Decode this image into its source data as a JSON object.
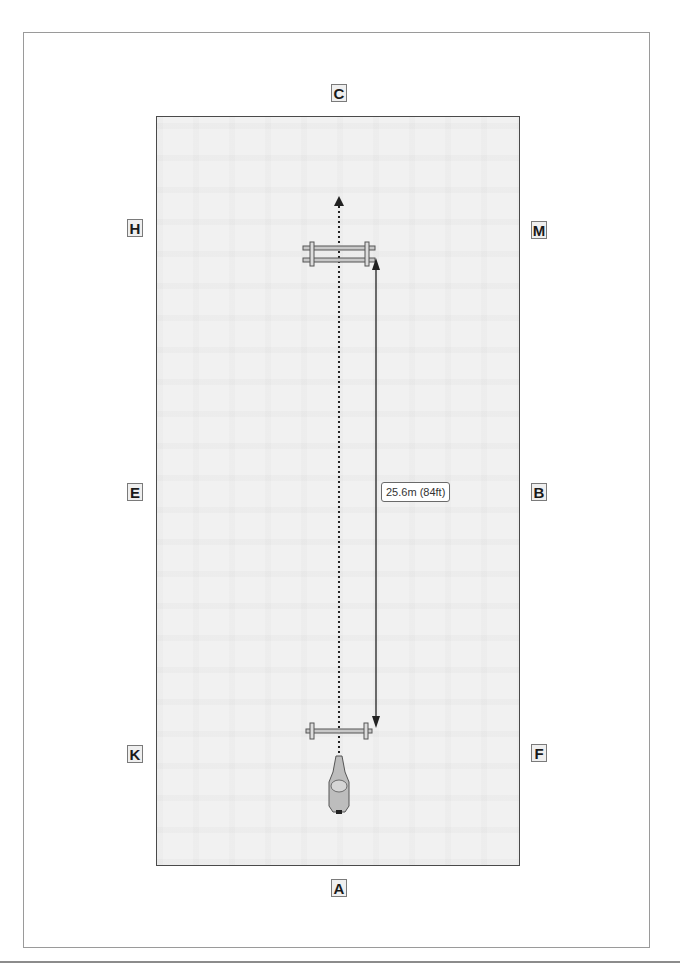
{
  "diagram": {
    "type": "arena-exercise-diagram",
    "arena": {
      "shape": "rectangle",
      "background": "#f1f1f1",
      "border": "#4a4a4a"
    },
    "letters": [
      {
        "id": "C",
        "label": "C",
        "position": "top-center"
      },
      {
        "id": "H",
        "label": "H",
        "position": "left-upper"
      },
      {
        "id": "M",
        "label": "M",
        "position": "right-upper"
      },
      {
        "id": "E",
        "label": "E",
        "position": "left-middle"
      },
      {
        "id": "B",
        "label": "B",
        "position": "right-middle"
      },
      {
        "id": "K",
        "label": "K",
        "position": "left-lower"
      },
      {
        "id": "F",
        "label": "F",
        "position": "right-lower"
      },
      {
        "id": "A",
        "label": "A",
        "position": "bottom-center"
      }
    ],
    "obstacles": [
      {
        "id": "oxer",
        "kind": "double-rail-fence",
        "near": "H-M line"
      },
      {
        "id": "vertical",
        "kind": "single-rail-fence",
        "near": "K-F line"
      }
    ],
    "path": {
      "style": "dotted",
      "direction": "toward C",
      "from": "A end",
      "to": "C end"
    },
    "measurement": {
      "label": "25.6m (84ft)",
      "between": "vertical and oxer"
    },
    "rider": {
      "icon": "horse-and-rider-top-view",
      "position": "approaching vertical from A"
    }
  }
}
